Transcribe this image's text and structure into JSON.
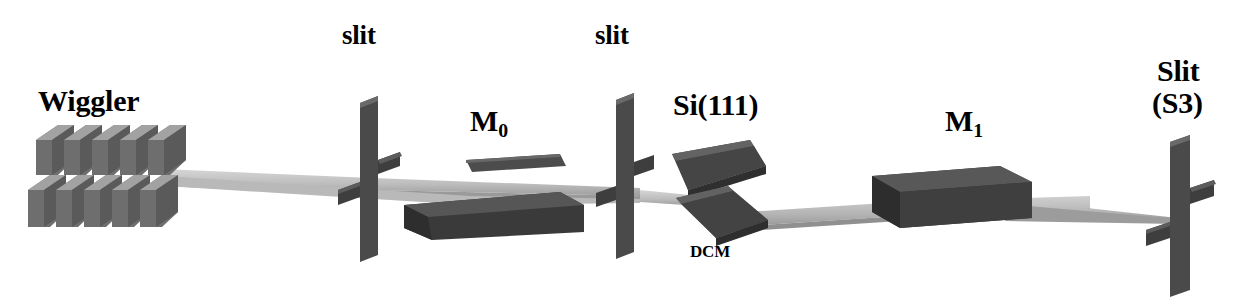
{
  "figure": {
    "type": "beamline-schematic",
    "background_color": "#ffffff",
    "ink_color": "#000000"
  },
  "palette": {
    "block_dark": "#3c3c3c",
    "block_mid": "#545454",
    "block_light": "#6e6e6e",
    "magnet_light": "#8f8f8f",
    "magnet_mid": "#6b6b6b",
    "magnet_dark": "#4a4a4a",
    "beam_light": "#c9c9c9",
    "beam_mid": "#a8a8a8",
    "beam_dark": "#8a8a8a"
  },
  "labels": [
    {
      "id": "wiggler",
      "text": "Wiggler",
      "x": 38,
      "y": 86,
      "size": "big"
    },
    {
      "id": "slit1",
      "text": "slit",
      "x": 342,
      "y": 22,
      "size": "med"
    },
    {
      "id": "m0",
      "text": "M",
      "sub": "0",
      "x": 470,
      "y": 106,
      "size": "big"
    },
    {
      "id": "slit2",
      "text": "slit",
      "x": 595,
      "y": 22,
      "size": "med"
    },
    {
      "id": "si111",
      "text": "Si(111)",
      "x": 673,
      "y": 90,
      "size": "big"
    },
    {
      "id": "dcm",
      "text": "DCM",
      "x": 690,
      "y": 243,
      "size": "small"
    },
    {
      "id": "m1",
      "text": "M",
      "sub": "1",
      "x": 945,
      "y": 106,
      "size": "big"
    },
    {
      "id": "slit_s3_line1",
      "text": "Slit",
      "x": 1157,
      "y": 56,
      "size": "big"
    },
    {
      "id": "slit_s3_line2",
      "text": "(S3)",
      "x": 1152,
      "y": 88,
      "size": "big"
    }
  ],
  "components": [
    {
      "id": "wiggler",
      "name": "Wiggler magnet array",
      "rows": 2,
      "poles_per_row": 5
    },
    {
      "id": "slit-1",
      "name": "Slit 1",
      "shape": "cross-blade",
      "axis_x": 372
    },
    {
      "id": "mirror-m0",
      "name": "M0 mirror",
      "shape": "flat-slab-pair"
    },
    {
      "id": "slit-2",
      "name": "Slit 2",
      "shape": "cross-blade",
      "axis_x": 626
    },
    {
      "id": "dcm",
      "name": "Si(111) double-crystal monochromator",
      "crystals": 2
    },
    {
      "id": "mirror-m1",
      "name": "M1 mirror",
      "shape": "thick-slab"
    },
    {
      "id": "slit-s3",
      "name": "Slit S3",
      "shape": "cross-blade",
      "axis_x": 1180
    }
  ],
  "beam": {
    "name": "x-ray-beam-ribbon",
    "source_x": 160,
    "focus_x": 1180,
    "segments": [
      "wiggler-to-slit1",
      "slit1-to-m0",
      "m0-to-slit2",
      "slit2-to-dcm",
      "dcm-to-m1",
      "m1-to-s3"
    ]
  }
}
